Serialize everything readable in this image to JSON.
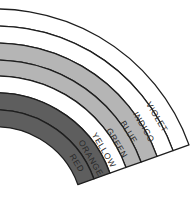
{
  "diagram": {
    "geometry": {
      "cx": -4,
      "cy": 214,
      "start_deg": -100,
      "end_deg": -19.7
    },
    "outline_color": "#1e1e1e",
    "bands": [
      {
        "label": "VIOLET",
        "r_outer": 205,
        "r_inner": 188,
        "fill": "#ffffff",
        "label_x": 157,
        "label_y": 117
      },
      {
        "label": "INDIGO",
        "r_outer": 188,
        "r_inner": 171,
        "fill": "#ffffff",
        "label_x": 144,
        "label_y": 127
      },
      {
        "label": "BLUE",
        "r_outer": 171,
        "r_inner": 154,
        "fill": "#b5b5b5",
        "label_x": 129,
        "label_y": 132
      },
      {
        "label": "GREEN",
        "r_outer": 154,
        "r_inner": 138,
        "fill": "#b5b5b5",
        "label_x": 117,
        "label_y": 143
      },
      {
        "label": "YELLOW",
        "r_outer": 138,
        "r_inner": 121,
        "fill": "#ffffff",
        "label_x": 104,
        "label_y": 150
      },
      {
        "label": "ORANGE",
        "r_outer": 121,
        "r_inner": 104,
        "fill": "#5e5e5e",
        "label_x": 91,
        "label_y": 158
      },
      {
        "label": "RED",
        "r_outer": 104,
        "r_inner": 87,
        "fill": "#5e5e5e",
        "label_x": 77,
        "label_y": 163
      }
    ]
  }
}
